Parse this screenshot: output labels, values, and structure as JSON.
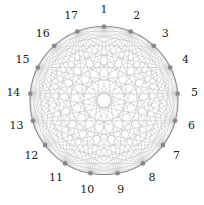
{
  "diagram": {
    "type": "complete-graph",
    "node_count": 17,
    "labels": [
      "1",
      "2",
      "3",
      "4",
      "5",
      "6",
      "7",
      "8",
      "9",
      "10",
      "11",
      "12",
      "13",
      "14",
      "15",
      "16",
      "17"
    ],
    "edges": "all-pairs",
    "colors": {
      "edge": "#b8b8b8",
      "outer_circle": "#888888",
      "node": "#888888",
      "label": "#222222"
    }
  }
}
